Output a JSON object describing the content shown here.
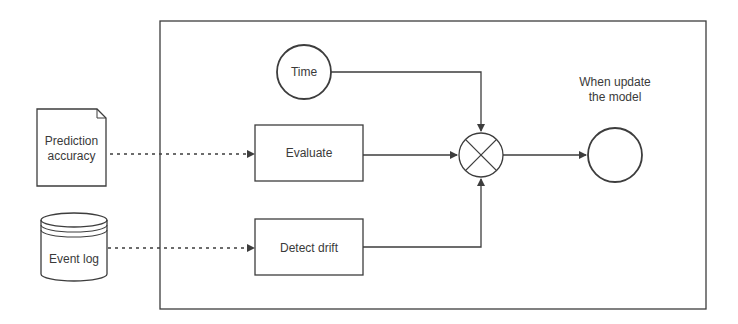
{
  "diagram": {
    "type": "flow",
    "colors": {
      "line": "#3d3d3d",
      "text": "#3a3a3a",
      "background": "#ffffff"
    },
    "external_inputs": [
      {
        "id": "prediction_accuracy",
        "shape": "document",
        "label_lines": [
          "Prediction",
          "accuracy"
        ]
      },
      {
        "id": "event_log",
        "shape": "database-cylinder",
        "label": "Event log"
      }
    ],
    "container": {
      "id": "process-boundary"
    },
    "nodes": {
      "time": {
        "shape": "circle",
        "label": "Time"
      },
      "evaluate": {
        "shape": "rectangle",
        "label": "Evaluate"
      },
      "detect_drift": {
        "shape": "rectangle",
        "label": "Detect drift"
      },
      "combiner": {
        "shape": "circle-x"
      },
      "output": {
        "shape": "circle",
        "label_lines": [
          "When update",
          "the model"
        ]
      }
    },
    "edges": [
      {
        "from": "prediction_accuracy",
        "to": "evaluate",
        "style": "dashed"
      },
      {
        "from": "event_log",
        "to": "detect_drift",
        "style": "dashed"
      },
      {
        "from": "time",
        "to": "combiner",
        "style": "solid"
      },
      {
        "from": "evaluate",
        "to": "combiner",
        "style": "solid"
      },
      {
        "from": "detect_drift",
        "to": "combiner",
        "style": "solid"
      },
      {
        "from": "combiner",
        "to": "output",
        "style": "solid"
      }
    ]
  }
}
